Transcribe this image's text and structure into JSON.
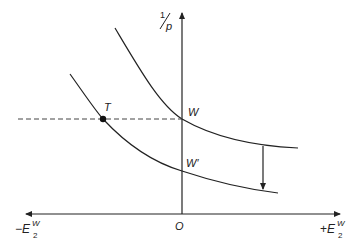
{
  "diagram": {
    "y_axis": {
      "label_num": "1",
      "label_den": "p"
    },
    "x_axis": {
      "left_label": {
        "sign": "−",
        "base": "E",
        "sup": "W",
        "sub": "2"
      },
      "right_label": {
        "sign": "+",
        "base": "E",
        "sup": "W",
        "sub": "2"
      },
      "origin_label": "O"
    },
    "points": {
      "T": "T",
      "W": "W",
      "W_prime": "W′"
    },
    "curves": [
      {
        "name": "upper-curve",
        "passes_through": "W"
      },
      {
        "name": "lower-curve",
        "passes_through": [
          "T",
          "W′"
        ]
      }
    ],
    "annotations": {
      "dashed_line": "horizontal through T and W",
      "shift_arrow": "downward shift from upper curve to lower curve"
    },
    "colors": {
      "line": "#222222",
      "dashed": "#444444"
    }
  }
}
